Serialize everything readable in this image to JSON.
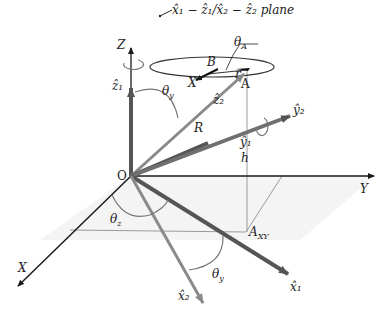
{
  "diagram": {
    "type": "3d-coordinate-frame",
    "plane_label": "x̂₁ − ẑ₁/x̂₂ − ẑ₂ plane",
    "origin": "O",
    "axes": {
      "x": "X",
      "y": "Y",
      "z": "Z"
    },
    "vectors": {
      "z1": "ẑ₁",
      "z2": "ẑ₂",
      "y1": "ŷ₁",
      "y2": "ŷ₂",
      "x1": "x̂₁",
      "x2": "x̂₂"
    },
    "points": {
      "A": "A",
      "B": "B",
      "X_pt": "X",
      "A_XY": "A",
      "A_XY_sub": "XY"
    },
    "lengths": {
      "R": "R",
      "h": "h",
      "r": "r"
    },
    "angles": {
      "theta_A": "θ",
      "theta_A_sub": "A",
      "theta_y_top": "θ",
      "theta_y_top_sub": "y",
      "theta_y_bottom": "θ",
      "theta_y_bottom_sub": "y",
      "theta_z": "θ",
      "theta_z_sub": "z"
    },
    "colors": {
      "axis": "#1a1a1a",
      "frame1": "#555555",
      "frame2": "#8a8a8a",
      "guide": "#9a9a9a"
    }
  }
}
